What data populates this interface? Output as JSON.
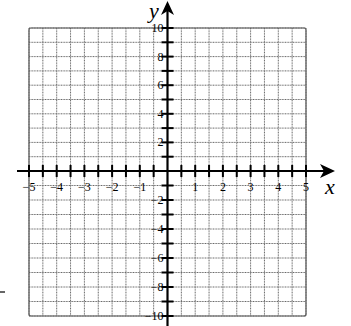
{
  "chart_data": {
    "type": "scatter",
    "title": "",
    "xlabel": "x",
    "ylabel": "y",
    "xlim": [
      -5,
      5
    ],
    "ylim": [
      -10,
      10
    ],
    "grid": true,
    "x_grid_step": 0.5,
    "y_grid_step": 1,
    "x_tick_step": 0.5,
    "y_tick_step": 1,
    "x_tick_labels": [
      "-5",
      "-4",
      "-3",
      "-2",
      "-1",
      "1",
      "2",
      "3",
      "4",
      "5"
    ],
    "y_tick_labels": [
      "10",
      "8",
      "6",
      "4",
      "2",
      "-2",
      "-4",
      "-6",
      "-8",
      "-10"
    ],
    "series": [],
    "legend": null
  },
  "axes": {
    "x_label": "x",
    "y_label": "y",
    "x_labels": [
      {
        "value": -5,
        "text": "−5"
      },
      {
        "value": -4,
        "text": "−4"
      },
      {
        "value": -3,
        "text": "−3"
      },
      {
        "value": -2,
        "text": "−2"
      },
      {
        "value": -1,
        "text": "−1"
      },
      {
        "value": 1,
        "text": "1"
      },
      {
        "value": 2,
        "text": "2"
      },
      {
        "value": 3,
        "text": "3"
      },
      {
        "value": 4,
        "text": "4"
      },
      {
        "value": 5,
        "text": "5"
      }
    ],
    "y_labels": [
      {
        "value": 10,
        "text": "10"
      },
      {
        "value": 8,
        "text": "8"
      },
      {
        "value": 6,
        "text": "6"
      },
      {
        "value": 4,
        "text": "4"
      },
      {
        "value": 2,
        "text": "2"
      },
      {
        "value": -2,
        "text": "−2"
      },
      {
        "value": -4,
        "text": "−4"
      },
      {
        "value": -6,
        "text": "−6"
      },
      {
        "value": -8,
        "text": "−8"
      },
      {
        "value": -10,
        "text": "−10"
      }
    ]
  },
  "colors": {
    "grid": "#6a6a6a",
    "axis": "#000000",
    "background": "#ffffff"
  }
}
